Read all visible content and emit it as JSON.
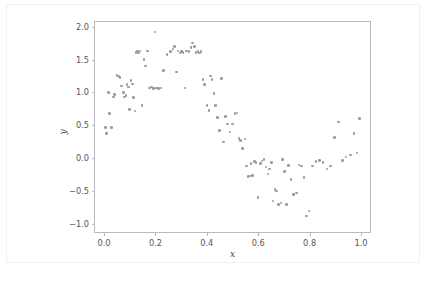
{
  "figure": {
    "background_color": "#ffffff",
    "card_border_color": "#f0f0f2",
    "axes_edge_color": "#b8b8bd",
    "marker_color": "#9a9aa2"
  },
  "chart_data": {
    "type": "scatter",
    "title": "",
    "subtitle": "",
    "xlabel": "x",
    "ylabel": "y",
    "xlim": [
      -0.035,
      1.035
    ],
    "ylim": [
      -1.12,
      2.07
    ],
    "xticks": [
      0.0,
      0.2,
      0.4,
      0.6,
      0.8,
      1.0
    ],
    "xtick_labels": [
      "0.0",
      "0.2",
      "0.4",
      "0.6",
      "0.8",
      "1.0"
    ],
    "yticks": [
      -1.0,
      -0.5,
      0.0,
      0.5,
      1.0,
      1.5,
      2.0
    ],
    "ytick_labels": [
      "−1.0",
      "−0.5",
      "0.0",
      "0.5",
      "1.0",
      "1.5",
      "2.0"
    ],
    "grid": false,
    "legend": null,
    "annotations": [],
    "marker_size": 2.6,
    "series": [
      {
        "name": "samples",
        "color": "#9a9aa2",
        "n_points": 120,
        "x": [
          0.005,
          0.01,
          0.018,
          0.022,
          0.03,
          0.038,
          0.042,
          0.05,
          0.058,
          0.062,
          0.068,
          0.075,
          0.08,
          0.086,
          0.09,
          0.095,
          0.1,
          0.105,
          0.11,
          0.115,
          0.12,
          0.125,
          0.13,
          0.135,
          0.14,
          0.148,
          0.155,
          0.162,
          0.17,
          0.178,
          0.185,
          0.192,
          0.198,
          0.205,
          0.212,
          0.222,
          0.232,
          0.245,
          0.258,
          0.268,
          0.275,
          0.282,
          0.288,
          0.295,
          0.302,
          0.308,
          0.315,
          0.322,
          0.33,
          0.338,
          0.345,
          0.352,
          0.358,
          0.365,
          0.372,
          0.378,
          0.385,
          0.392,
          0.4,
          0.408,
          0.415,
          0.42,
          0.428,
          0.435,
          0.442,
          0.45,
          0.458,
          0.465,
          0.472,
          0.48,
          0.49,
          0.5,
          0.51,
          0.518,
          0.525,
          0.532,
          0.54,
          0.548,
          0.555,
          0.56,
          0.565,
          0.572,
          0.578,
          0.585,
          0.592,
          0.6,
          0.608,
          0.615,
          0.622,
          0.63,
          0.638,
          0.645,
          0.652,
          0.658,
          0.665,
          0.672,
          0.68,
          0.688,
          0.695,
          0.702,
          0.71,
          0.718,
          0.728,
          0.738,
          0.748,
          0.758,
          0.768,
          0.778,
          0.788,
          0.798,
          0.812,
          0.825,
          0.838,
          0.852,
          0.868,
          0.882,
          0.898,
          0.912,
          0.928,
          0.942,
          0.958,
          0.972,
          0.985,
          0.995
        ],
        "y": [
          0.47,
          0.38,
          1.0,
          0.68,
          0.47,
          0.93,
          0.97,
          1.26,
          1.24,
          1.23,
          1.1,
          1.0,
          0.93,
          0.95,
          1.12,
          1.08,
          0.74,
          1.18,
          1.13,
          0.92,
          0.72,
          1.61,
          1.62,
          1.6,
          1.63,
          0.8,
          1.5,
          1.4,
          1.63,
          1.07,
          1.08,
          1.06,
          1.92,
          1.07,
          1.06,
          1.07,
          1.33,
          1.58,
          1.62,
          1.66,
          1.7,
          1.31,
          1.63,
          1.6,
          1.62,
          1.61,
          1.07,
          1.63,
          1.62,
          1.68,
          1.75,
          1.7,
          1.61,
          1.62,
          1.6,
          1.62,
          1.2,
          1.12,
          0.8,
          0.73,
          1.25,
          1.2,
          0.98,
          0.8,
          0.62,
          0.42,
          1.21,
          0.25,
          0.63,
          0.52,
          0.4,
          0.52,
          0.68,
          0.69,
          0.3,
          0.27,
          0.15,
          0.29,
          -0.12,
          -0.28,
          -0.27,
          -0.08,
          -0.26,
          -0.05,
          -0.06,
          -0.6,
          -0.08,
          -0.04,
          -0.02,
          -0.13,
          -0.24,
          -0.16,
          -0.06,
          -0.65,
          -0.47,
          -0.5,
          -0.7,
          -0.68,
          -0.02,
          -0.2,
          -0.7,
          -0.11,
          -0.32,
          -0.55,
          -0.53,
          -0.1,
          -0.12,
          -0.29,
          -0.88,
          -0.8,
          -0.12,
          -0.05,
          -0.03,
          -0.06,
          -0.16,
          -0.12,
          0.32,
          0.55,
          -0.03,
          0.02,
          0.05,
          0.38,
          0.08,
          0.6
        ]
      }
    ]
  }
}
